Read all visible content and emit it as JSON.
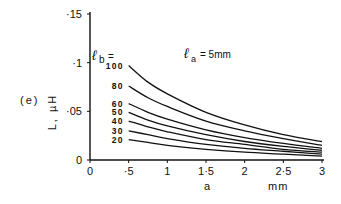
{
  "chart_data": {
    "type": "line",
    "panel_label": "(e)",
    "title": "",
    "annotation": "ℓa = 5mm",
    "annotation_parts": {
      "symbol": "ℓ",
      "sub": "a",
      "rest": "= 5mm"
    },
    "legend_title": "ℓb =",
    "legend_title_parts": {
      "symbol": "ℓ",
      "sub": "b",
      "rest": "="
    },
    "xlabel": "a     mm",
    "ylabel": "L, µH",
    "xlim": [
      0,
      3
    ],
    "ylim": [
      0,
      0.15
    ],
    "x_ticks": [
      0,
      0.5,
      1,
      1.5,
      2,
      2.5,
      3
    ],
    "x_tick_labels": [
      "0",
      "·5",
      "1",
      "1·5",
      "2",
      "2·5",
      "3"
    ],
    "y_ticks": [
      0,
      0.05,
      0.1,
      0.15
    ],
    "y_tick_labels": [
      "0",
      "·05",
      "·1",
      "·15"
    ],
    "grid": false,
    "x": [
      0.5,
      0.75,
      1.0,
      1.5,
      2.0,
      2.5,
      3.0
    ],
    "series": [
      {
        "name": "100",
        "values": [
          0.097,
          0.08,
          0.068,
          0.049,
          0.036,
          0.026,
          0.019
        ]
      },
      {
        "name": "80",
        "values": [
          0.076,
          0.064,
          0.055,
          0.04,
          0.03,
          0.022,
          0.015
        ]
      },
      {
        "name": "60",
        "values": [
          0.058,
          0.049,
          0.042,
          0.031,
          0.023,
          0.017,
          0.012
        ]
      },
      {
        "name": "50",
        "values": [
          0.049,
          0.041,
          0.035,
          0.026,
          0.019,
          0.014,
          0.01
        ]
      },
      {
        "name": "40",
        "values": [
          0.04,
          0.034,
          0.029,
          0.021,
          0.016,
          0.011,
          0.008
        ]
      },
      {
        "name": "30",
        "values": [
          0.03,
          0.026,
          0.022,
          0.016,
          0.012,
          0.009,
          0.006
        ]
      },
      {
        "name": "20",
        "values": [
          0.021,
          0.018,
          0.015,
          0.011,
          0.008,
          0.006,
          0.004
        ]
      }
    ],
    "colors": {
      "ink": "#111111",
      "background": "#ffffff"
    }
  }
}
